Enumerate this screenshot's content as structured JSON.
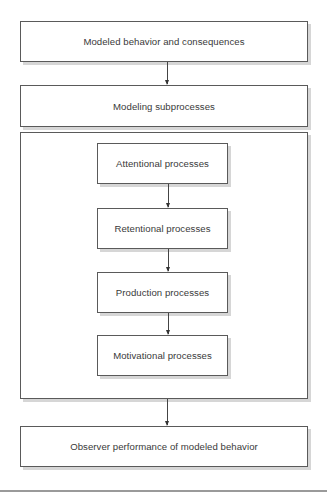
{
  "diagram": {
    "type": "flowchart",
    "nodes": {
      "top": "Modeled behavior and consequences",
      "subprocesses": "Modeling subprocesses",
      "inner": [
        "Attentional processes",
        "Retentional processes",
        "Production processes",
        "Motivational processes"
      ],
      "bottom": "Observer performance of modeled behavior"
    },
    "edges": [
      [
        "Modeled behavior and consequences",
        "Modeling subprocesses"
      ],
      [
        "Attentional processes",
        "Retentional processes"
      ],
      [
        "Retentional processes",
        "Production processes"
      ],
      [
        "Production processes",
        "Motivational processes"
      ],
      [
        "Modeling subprocesses (group)",
        "Observer performance of modeled behavior"
      ]
    ]
  }
}
